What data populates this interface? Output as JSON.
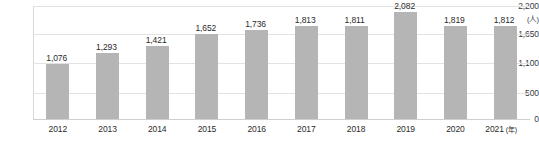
{
  "chart_data": {
    "type": "bar",
    "title": "",
    "xlabel": "年",
    "ylabel": "人",
    "unit_label": "(人)",
    "xaxis_unit_label": "(年)",
    "categories": [
      "2012",
      "2013",
      "2014",
      "2015",
      "2016",
      "2017",
      "2018",
      "2019",
      "2020",
      "2021"
    ],
    "values": [
      1076,
      1293,
      1421,
      1652,
      1736,
      1813,
      1811,
      2082,
      1819,
      1812
    ],
    "value_labels": [
      "1,076",
      "1,293",
      "1,421",
      "1,652",
      "1,736",
      "1,813",
      "1,811",
      "2,082",
      "1,819",
      "1,812"
    ],
    "ylim": [
      0,
      2200
    ],
    "ytick_values": [
      0,
      500,
      1100,
      1650,
      2200
    ],
    "ytick_labels": [
      "0",
      "500",
      "1,100",
      "1,650",
      "2,200"
    ],
    "grid": true,
    "legend": "none",
    "series_color": "#b5b5b5",
    "gridline_color": "#e2e2e2",
    "text_color": "#2b2b2b"
  }
}
